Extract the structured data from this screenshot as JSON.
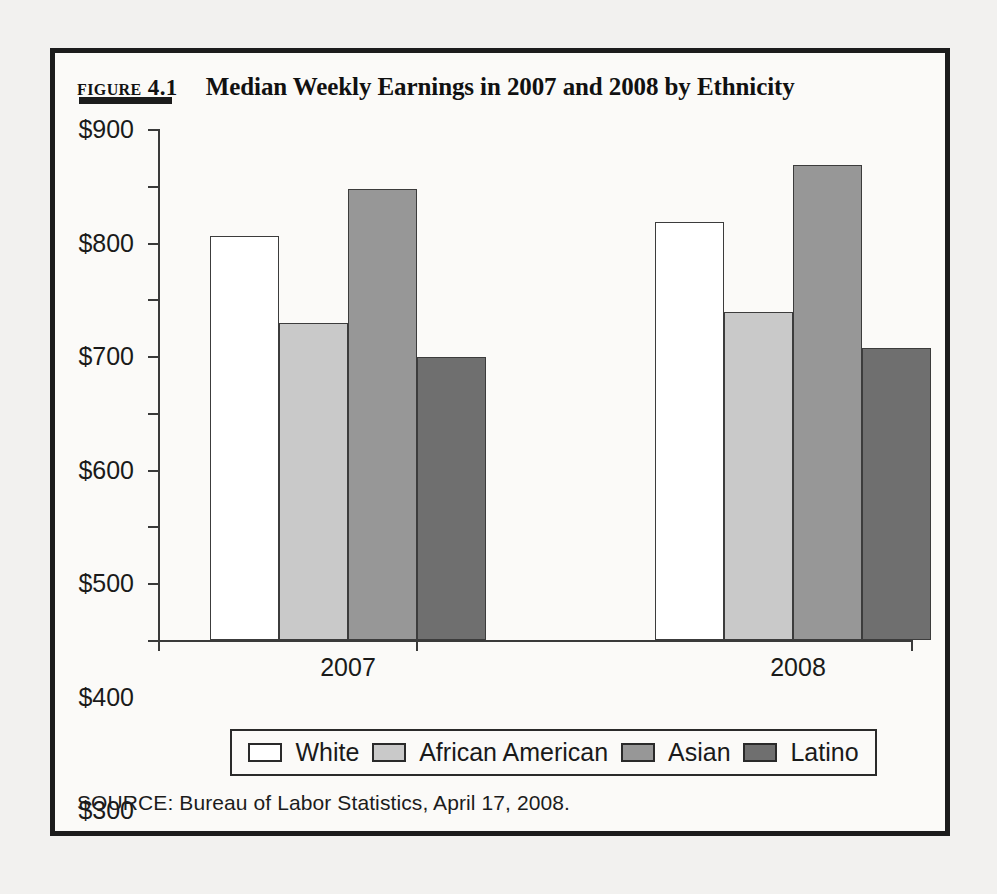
{
  "figure": {
    "number": "Figure 4.1",
    "title": "Median Weekly Earnings in 2007 and 2008 by Ethnicity",
    "source": "SOURCE: Bureau of Labor Statistics, April 17, 2008."
  },
  "legend": {
    "items": [
      {
        "label": "White",
        "swatch": "white"
      },
      {
        "label": "African American",
        "swatch": "light-gray"
      },
      {
        "label": "Asian",
        "swatch": "mid-gray"
      },
      {
        "label": "Latino",
        "swatch": "dark-gray"
      }
    ]
  },
  "axis": {
    "y_ticks": [
      "$900",
      "$800",
      "$700",
      "$600",
      "$500",
      "$400",
      "$300",
      "$200",
      "$100",
      "$0"
    ],
    "x_labels": [
      "2007",
      "2008"
    ]
  },
  "colors": {
    "white": "#ffffff",
    "light_gray": "#c9c9c9",
    "mid_gray": "#979797",
    "dark_gray": "#6f6f6f",
    "frame": "#1c1c1c",
    "axis": "#3a3a3a",
    "page_background": "#f2f1ef",
    "figure_background": "#fbfaf8"
  },
  "chart_data": {
    "type": "bar",
    "title": "Median Weekly Earnings in 2007 and 2008 by Ethnicity",
    "xlabel": "",
    "ylabel": "",
    "categories": [
      "2007",
      "2008"
    ],
    "series": [
      {
        "name": "White",
        "values": [
          712,
          737
        ]
      },
      {
        "name": "African American",
        "values": [
          558,
          577
        ]
      },
      {
        "name": "Asian",
        "values": [
          795,
          836
        ]
      },
      {
        "name": "Latino",
        "values": [
          499,
          515
        ]
      }
    ],
    "ylim": [
      0,
      900
    ],
    "ytick_step": 100,
    "ytick_prefix": "$",
    "grid": false,
    "legend_position": "bottom",
    "source": "Bureau of Labor Statistics, April 17, 2008."
  }
}
